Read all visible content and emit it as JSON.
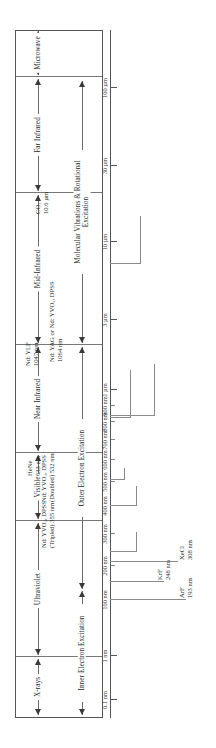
{
  "figure": {
    "orientation": "rotated-90-ccw"
  },
  "bands": [
    {
      "label": "X-rays",
      "start": 0.08,
      "end": 1.0
    },
    {
      "label": "Ultraviolet",
      "start": 1.0,
      "end": 380
    },
    {
      "label": "Visible",
      "start": 380,
      "end": 760
    },
    {
      "label": "Near Infrared",
      "start": 760,
      "end": 3000
    },
    {
      "label": "Mid-Infrared",
      "start": 3000,
      "end": 25000
    },
    {
      "label": "Far Infrared",
      "start": 25000,
      "end": 300000
    },
    {
      "label": "Microwave",
      "start": 300000,
      "end": 1000000
    }
  ],
  "processes": [
    {
      "label": "Inner Electron Excitation",
      "start": 0.08,
      "end": 100
    },
    {
      "label": "Outer Electron Excitation",
      "start": 100,
      "end": 3000
    },
    {
      "label": "Molecular Vibrations & Rotational Excitation",
      "start": 3000,
      "end": 300000
    }
  ],
  "axis": {
    "ticks": [
      {
        "label": "0.1 nm",
        "major": true
      },
      {
        "label": "1 nm",
        "major": true
      },
      {
        "label": "100 nm",
        "major": true
      },
      {
        "label": "200 nm",
        "major": true
      },
      {
        "label": "300 nm",
        "major": true
      },
      {
        "label": "400 nm",
        "major": true
      },
      {
        "label": "500 nm",
        "major": true
      },
      {
        "label": "600 nm",
        "major": true
      },
      {
        "label": "700 nm",
        "major": true
      },
      {
        "label": "800 nm",
        "major": true
      },
      {
        "label": "900 nm",
        "major": true
      },
      {
        "label": "1 µm",
        "major": true
      },
      {
        "label": "3 µm",
        "major": true
      },
      {
        "label": "10 µm",
        "major": true
      },
      {
        "label": "30 µm",
        "major": true
      },
      {
        "label": "100 µm",
        "major": true
      }
    ]
  },
  "lasers": [
    {
      "name": "ArF",
      "wavelength": "193 nm",
      "line1": "ArF",
      "line2": "193 nm"
    },
    {
      "name": "KrF",
      "wavelength": "248 nm",
      "line1": "KrF",
      "line2": "248 nm"
    },
    {
      "name": "XeCl",
      "wavelength": "308 nm",
      "line1": "XeCl",
      "line2": "308 nm"
    },
    {
      "name": "Nd: YVO4, DPSS (Tripled)",
      "wavelength": "355 nm",
      "line1": "Nd: YVO₄, DPSS",
      "line2": "(Tripled) 355 nm"
    },
    {
      "name": "Nd: YVO4, DPSS (Doubled)",
      "wavelength": "532 nm",
      "line1": "Nd: YVO₄, DPSS",
      "line2": "(Doubled) 532 nm"
    },
    {
      "name": "HeNe",
      "wavelength": "633 nm",
      "line1": "HeNe",
      "line2": "633 nm"
    },
    {
      "name": "Nd: YLF",
      "wavelength": "1047 nm",
      "line1": "Nd: YLF",
      "line2": "1047 nm"
    },
    {
      "name": "Nd: YAG or Nd: YVO4, DPSS",
      "wavelength": "1064 nm",
      "line1": "Nd: YAG or Nd: YVO₄, DPSS",
      "line2": "1064 nm"
    },
    {
      "name": "CO2",
      "wavelength": "10.6 µm",
      "line1": "CO₂",
      "line2": "10.6 µm"
    }
  ],
  "colors": {
    "frame": "#555555",
    "rule": "#6a6a6a",
    "text": "#2b2b2b",
    "callout": "#8a8a8a"
  }
}
